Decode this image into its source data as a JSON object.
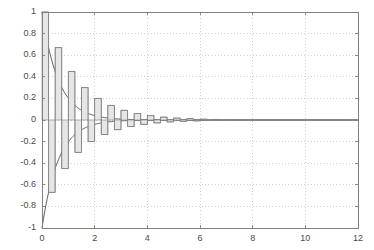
{
  "chart_data": {
    "type": "line",
    "title": "",
    "subtitle": "",
    "xlabel": "",
    "ylabel": "",
    "xlim": [
      0,
      12
    ],
    "ylim": [
      -1,
      1
    ],
    "grid": true,
    "grid_style": "dotted",
    "legend": null,
    "legend_position": "none",
    "x_ticks": [
      0,
      2,
      4,
      6,
      8,
      10,
      12
    ],
    "x_tick_labels": [
      "0",
      "2",
      "4",
      "6",
      "8",
      "10",
      "12"
    ],
    "y_ticks": [
      -1,
      -0.8,
      -0.6,
      -0.4,
      -0.2,
      0,
      0.2,
      0.4,
      0.6,
      0.8,
      1
    ],
    "y_tick_labels": [
      "-1",
      "-0.8",
      "-0.6",
      "-0.4",
      "-0.2",
      "0",
      "0.2",
      "0.4",
      "0.6",
      "0.8",
      "1"
    ],
    "series": [
      {
        "name": "staircase-signal",
        "style": "stairs",
        "color": "#808080",
        "fill": "#e6e6e6",
        "sample_interval": 0.25,
        "description": "Alternating-sign exponentially damped staircase sequence",
        "x": [
          0,
          0.25,
          0.5,
          0.75,
          1,
          1.25,
          1.5,
          1.75,
          2,
          2.25,
          2.5,
          2.75,
          3,
          3.25,
          3.5,
          3.75,
          4,
          4.25,
          4.5,
          4.75,
          5,
          5.25,
          5.5,
          5.75,
          6,
          6.25,
          6.5,
          6.75,
          7,
          7.25,
          7.5,
          7.75,
          8,
          8.25,
          8.5,
          8.75,
          9,
          9.25,
          9.5,
          9.75,
          10,
          10.25,
          10.5,
          10.75,
          11,
          11.25,
          11.5,
          11.75,
          12
        ],
        "values": [
          1,
          -0.67,
          0.67,
          -0.45,
          0.45,
          -0.3,
          0.3,
          -0.2,
          0.2,
          -0.135,
          0.135,
          -0.09,
          0.09,
          -0.06,
          0.06,
          -0.04,
          0.04,
          -0.027,
          0.027,
          -0.018,
          0.018,
          -0.012,
          0.012,
          -0.008,
          0.008,
          -0.005,
          0.005,
          -0.0036,
          0.0036,
          -0.0024,
          0.0024,
          -0.0016,
          0.0016,
          -0.0011,
          0.0011,
          -0.0007,
          0.0007,
          -0.0005,
          0.0005,
          -0.0003,
          0.0003,
          -0.0002,
          0.0002,
          -0.00013,
          0.00013,
          -9e-05,
          9e-05,
          -6e-05,
          6e-05
        ]
      },
      {
        "name": "upper-envelope",
        "style": "line",
        "color": "#4d4d4d",
        "description": "Positive exponential decay envelope exp(-1.6x)",
        "decay_rate": 1.6,
        "amplitude": 1.0
      },
      {
        "name": "lower-envelope",
        "style": "line",
        "color": "#4d4d4d",
        "description": "Negative exponential decay envelope -exp(-1.6x)",
        "decay_rate": 1.6,
        "amplitude": -1.0
      }
    ],
    "axes_color": "#808080",
    "grid_color": "#bdbdbd",
    "background": "#ffffff"
  },
  "figure": {
    "plot_left": 42,
    "plot_top": 12,
    "plot_right": 358,
    "plot_bottom": 228
  }
}
